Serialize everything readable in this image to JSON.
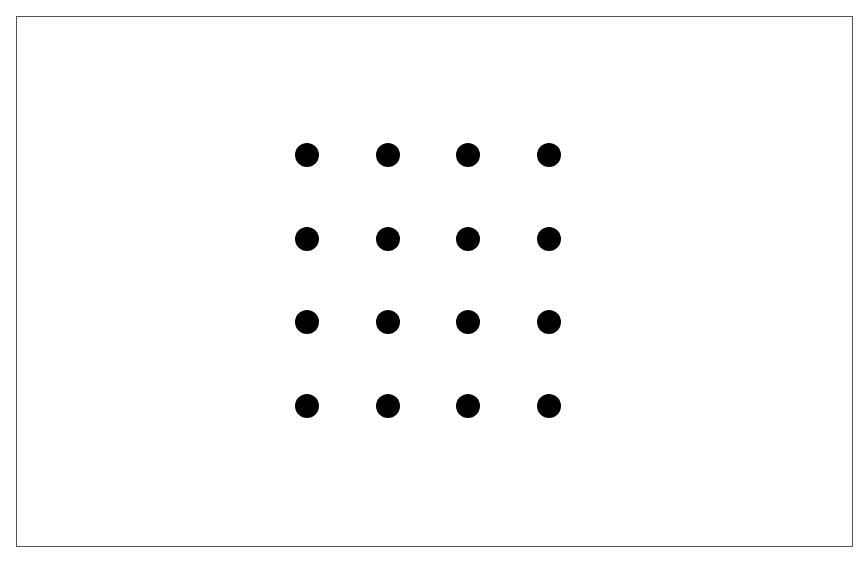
{
  "diagram": {
    "type": "dot-grid",
    "rows": 4,
    "columns": 4,
    "dot_color": "#000000",
    "border_color": "#555555",
    "background": "#ffffff",
    "dot_diameter": 24,
    "origin": [
      307,
      155
    ],
    "spacing_x": 80.5,
    "spacing_y": 83.7
  }
}
